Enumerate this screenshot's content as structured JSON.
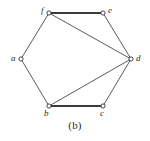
{
  "figure": {
    "caption": "(b)",
    "background_color": "#ffffff",
    "edge_color": "#4a4a4a",
    "bold_edge_color": "#3a3a3a",
    "vertex_fill": "#ffffff",
    "vertex_stroke": "#333333",
    "label_color": "#2b2b2b"
  },
  "chart_data": {
    "type": "diagram",
    "title": "(b)",
    "subtitle": "",
    "xlabel": "",
    "ylabel": "",
    "graph_kind": "undirected-simple-graph",
    "vertex_count": 6,
    "edge_count": 8,
    "vertices": [
      {
        "id": "a",
        "label": "a",
        "x": 21,
        "y": 59,
        "label_x": 11,
        "label_y": 54,
        "degree": 2
      },
      {
        "id": "b",
        "label": "b",
        "x": 49,
        "y": 106,
        "label_x": 44,
        "label_y": 109,
        "degree": 3
      },
      {
        "id": "c",
        "label": "c",
        "x": 103,
        "y": 106,
        "label_x": 100,
        "label_y": 109,
        "degree": 2
      },
      {
        "id": "d",
        "label": "d",
        "x": 131,
        "y": 59,
        "label_x": 136,
        "label_y": 54,
        "degree": 4
      },
      {
        "id": "e",
        "label": "e",
        "x": 103,
        "y": 13,
        "label_x": 108,
        "label_y": 6,
        "degree": 2
      },
      {
        "id": "f",
        "label": "f",
        "x": 49,
        "y": 13,
        "label_x": 41,
        "label_y": 6,
        "degree": 3
      }
    ],
    "edges": [
      {
        "from": "a",
        "to": "f",
        "bold": false
      },
      {
        "from": "f",
        "to": "e",
        "bold": true
      },
      {
        "from": "e",
        "to": "d",
        "bold": false
      },
      {
        "from": "d",
        "to": "c",
        "bold": false
      },
      {
        "from": "c",
        "to": "b",
        "bold": true
      },
      {
        "from": "b",
        "to": "a",
        "bold": false
      },
      {
        "from": "f",
        "to": "d",
        "bold": false
      },
      {
        "from": "b",
        "to": "d",
        "bold": false
      }
    ],
    "legend": [],
    "annotations": [
      {
        "text": "(b)",
        "x": 75,
        "y": 126,
        "role": "figure-caption"
      }
    ],
    "grid": false,
    "axis_visible": false
  }
}
